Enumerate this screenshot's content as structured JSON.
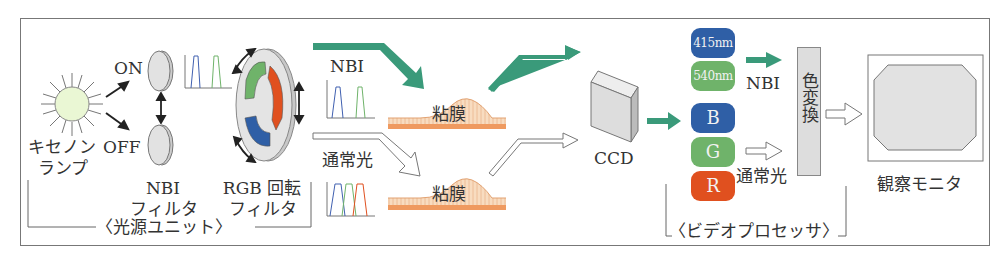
{
  "diagram": {
    "light_source_unit": {
      "group_label": "〈光源ユニット〉",
      "lamp_label_line1": "キセノン",
      "lamp_label_line2": "ランプ",
      "switch_on": "ON",
      "switch_off": "OFF",
      "nbi_filter_line1": "NBI",
      "nbi_filter_line2": "フィルタ",
      "rgb_filter_line1": "RGB 回転",
      "rgb_filter_line2": "フィルタ"
    },
    "paths": {
      "nbi_label": "NBI",
      "normal_label": "通常光",
      "mucosa_top": "粘膜",
      "mucosa_bottom": "粘膜"
    },
    "ccd_label": "CCD",
    "video_processor": {
      "group_label": "〈ビデオプロセッサ〉",
      "chips": [
        {
          "label": "415nm",
          "color": "#2f5fa6"
        },
        {
          "label": "540nm",
          "color": "#6fb36a"
        },
        {
          "label": "B",
          "color": "#2f5fa6"
        },
        {
          "label": "G",
          "color": "#6fb36a"
        },
        {
          "label": "R",
          "color": "#e0501f"
        }
      ],
      "nbi_output_label": "NBI",
      "normal_output_label": "通常光",
      "color_conversion": "色変換"
    },
    "monitor_label": "観察モニタ",
    "colors": {
      "teal_arrow": "#3a9a7a",
      "mucosa_fill": "#f6d2b0",
      "mucosa_base": "#ef9a60",
      "lamp_fill": "#eaf7d4",
      "rgb_green": "#6fb36a",
      "rgb_red": "#e0501f",
      "rgb_blue": "#2f5fa6"
    }
  }
}
